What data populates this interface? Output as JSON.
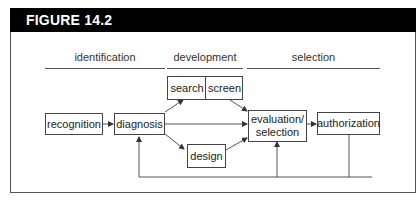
{
  "figure": {
    "title": "FIGURE 14.2"
  },
  "phases": [
    {
      "label": "identification"
    },
    {
      "label": "development"
    },
    {
      "label": "selection"
    }
  ],
  "nodes": {
    "recognition": "recognition",
    "diagnosis": "diagnosis",
    "search": "search",
    "screen": "screen",
    "design": "design",
    "evaluation_line1": "evaluation/",
    "evaluation_line2": "selection",
    "authorization": "authorization"
  },
  "edges": [
    {
      "from": "recognition",
      "to": "diagnosis"
    },
    {
      "from": "diagnosis",
      "to": "search"
    },
    {
      "from": "diagnosis",
      "to": "evaluation/selection"
    },
    {
      "from": "diagnosis",
      "to": "design"
    },
    {
      "from": "screen",
      "to": "evaluation/selection"
    },
    {
      "from": "design",
      "to": "evaluation/selection"
    },
    {
      "from": "evaluation/selection",
      "to": "authorization"
    },
    {
      "from": "authorization",
      "to": "diagnosis",
      "type": "feedback"
    },
    {
      "from": "authorization",
      "to": "evaluation/selection",
      "type": "feedback"
    }
  ],
  "colors": {
    "header_bg": "#000000",
    "header_text": "#ffffff",
    "line": "#555555"
  }
}
